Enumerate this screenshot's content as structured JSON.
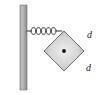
{
  "figure": {
    "name": "spring-block-diagram",
    "background_color": "#ffffff"
  },
  "wall": {
    "name": "wall",
    "color_light": "#b9b9b9",
    "color_dark": "#8c8c8c",
    "outline_color": "#6e6e6e",
    "x": 20,
    "y": 5,
    "width": 7,
    "height": 85
  },
  "spring": {
    "name": "coil-spring",
    "color": "#3a3a3a",
    "coil_count": 5,
    "start_x": 27,
    "end_x": 62,
    "center_y": 31
  },
  "block": {
    "name": "square-block",
    "shape": "diamond",
    "fill_center": "#e2e2e2",
    "fill_edge": "#a8a8a8",
    "outline_color": "#707070",
    "center_x": 64,
    "center_y": 51,
    "half_diagonal": 20,
    "center_dot_color": "#101010"
  },
  "labels": {
    "side_top_right": "d",
    "side_bottom_right": "d"
  }
}
